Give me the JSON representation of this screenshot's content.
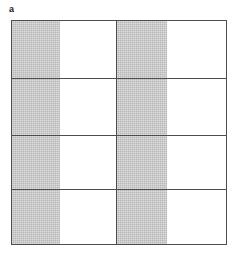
{
  "panel": {
    "label": "a",
    "caption": ""
  },
  "figure": {
    "frame": {
      "border_color": "#4d4d4d",
      "background_color": "#ffffff"
    },
    "shade_color": "#b6b6b6",
    "blank_color": "#ffffff",
    "columns": 2,
    "rows": 4,
    "column_widths_pct": [
      49.0,
      51.0
    ],
    "row_heights_pct": [
      26.0,
      25.5,
      24.5,
      24.0
    ],
    "band_fraction_pct": 46
  },
  "chart_data": {
    "type": "heatmap",
    "title": "a",
    "xlabel": "",
    "ylabel": "",
    "columns": 2,
    "rows": 4,
    "legend": [
      {
        "name": "shaded",
        "color": "#b6b6b6",
        "value": 1
      },
      {
        "name": "blank",
        "color": "#ffffff",
        "value": 0
      }
    ],
    "cells": [
      {
        "row": 1,
        "col": 1,
        "shaded_fraction": 0.46,
        "state": "shaded-left"
      },
      {
        "row": 1,
        "col": 2,
        "shaded_fraction": 0.46,
        "state": "shaded-left"
      },
      {
        "row": 2,
        "col": 1,
        "shaded_fraction": 0.46,
        "state": "shaded-left"
      },
      {
        "row": 2,
        "col": 2,
        "shaded_fraction": 0.46,
        "state": "shaded-left"
      },
      {
        "row": 3,
        "col": 1,
        "shaded_fraction": 0.46,
        "state": "shaded-left"
      },
      {
        "row": 3,
        "col": 2,
        "shaded_fraction": 0.46,
        "state": "shaded-left"
      },
      {
        "row": 4,
        "col": 1,
        "shaded_fraction": 0.46,
        "state": "shaded-left"
      },
      {
        "row": 4,
        "col": 2,
        "shaded_fraction": 0.46,
        "state": "shaded-left"
      }
    ],
    "grid": true,
    "legend_position": "none"
  }
}
